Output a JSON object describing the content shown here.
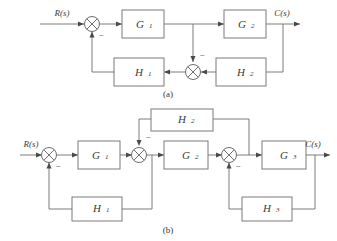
{
  "figure": {
    "background_color": "#ffffff",
    "line_color": "#6e6e6e",
    "text_color": "#3a3a3a",
    "diagrams": [
      {
        "id": "diagram-a",
        "caption": "(a)",
        "input_label": "R(s)",
        "output_label": "C(s)",
        "blocks": [
          {
            "label": "G",
            "subscript": "1"
          },
          {
            "label": "G",
            "subscript": "2"
          },
          {
            "label": "H",
            "subscript": "1"
          },
          {
            "label": "H",
            "subscript": "2"
          }
        ],
        "summing_junctions": [
          {
            "name": "input-summer",
            "sign": "−"
          },
          {
            "name": "feedback-summer",
            "sign": "−"
          }
        ]
      },
      {
        "id": "diagram-b",
        "caption": "(b)",
        "input_label": "R(s)",
        "output_label": "C(s)",
        "blocks": [
          {
            "label": "G",
            "subscript": "1"
          },
          {
            "label": "G",
            "subscript": "2"
          },
          {
            "label": "G",
            "subscript": "3"
          },
          {
            "label": "H",
            "subscript": "1"
          },
          {
            "label": "H",
            "subscript": "2"
          },
          {
            "label": "H",
            "subscript": "3"
          }
        ],
        "summing_junctions": [
          {
            "name": "input-summer",
            "sign": "−"
          },
          {
            "name": "inner-summer",
            "sign": "−"
          },
          {
            "name": "outer-summer",
            "sign": "−"
          }
        ]
      }
    ]
  }
}
